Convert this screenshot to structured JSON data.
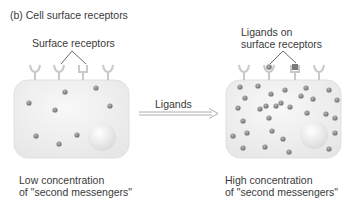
{
  "title": "(b)  Cell surface receptors",
  "left_cell": {
    "callout": "Surface receptors",
    "caption_line1": "Low concentration",
    "caption_line2": "of \"second messengers\"",
    "dots": [
      [
        65,
        92
      ],
      [
        96,
        88
      ],
      [
        29,
        103
      ],
      [
        55,
        110
      ],
      [
        110,
        106
      ],
      [
        36,
        136
      ],
      [
        77,
        135
      ],
      [
        59,
        144
      ]
    ]
  },
  "arrow": {
    "label": "Ligands"
  },
  "right_cell": {
    "callout_line1": "Ligands on",
    "callout_line2": "surface receptors",
    "caption_line1": "High concentration",
    "caption_line2": "of \"second messengers\"",
    "dots": [
      [
        240,
        87
      ],
      [
        258,
        86
      ],
      [
        271,
        94
      ],
      [
        285,
        90
      ],
      [
        306,
        88
      ],
      [
        301,
        96
      ],
      [
        329,
        90
      ],
      [
        245,
        98
      ],
      [
        281,
        103
      ],
      [
        266,
        106
      ],
      [
        313,
        99
      ],
      [
        337,
        100
      ],
      [
        238,
        108
      ],
      [
        260,
        109
      ],
      [
        276,
        106
      ],
      [
        290,
        107
      ],
      [
        307,
        113
      ],
      [
        326,
        114
      ],
      [
        243,
        121
      ],
      [
        269,
        118
      ],
      [
        335,
        118
      ],
      [
        233,
        136
      ],
      [
        247,
        133
      ],
      [
        272,
        131
      ],
      [
        283,
        139
      ],
      [
        335,
        133
      ],
      [
        243,
        148
      ],
      [
        265,
        147
      ],
      [
        289,
        152
      ],
      [
        329,
        149
      ]
    ]
  },
  "colors": {
    "cell_fill": "#ececec",
    "cell_stroke": "#e2e2e2",
    "dot": "#8a8a8a",
    "receptor": "#cfcfcf",
    "line": "#444444"
  }
}
